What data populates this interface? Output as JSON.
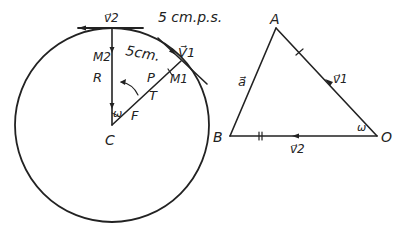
{
  "figure": {
    "type": "physics-kinematics-diagram",
    "left_panel": {
      "description": "Circle with center C, radius R, point moving along circumference",
      "labels": {
        "top_velocity": "v⃗2",
        "speed": "5 cm.p.s.",
        "arc_length": "5cm.",
        "tangent_velocity": "V⃗1",
        "point_m2": "M2",
        "point_m1": "M1",
        "radius": "R",
        "p": "P",
        "t": "T",
        "omega": "ω",
        "f": "F",
        "center": "C"
      }
    },
    "right_panel": {
      "description": "Velocity triangle A-B-O",
      "labels": {
        "vertex_a": "A",
        "vertex_b": "B",
        "vertex_o": "O",
        "side_ab": "a⃗",
        "side_ao": "v⃗1",
        "side_bo": "v⃗2",
        "angle_o": "ω"
      }
    },
    "colors": {
      "ink": "#222222",
      "background": "#ffffff"
    }
  }
}
